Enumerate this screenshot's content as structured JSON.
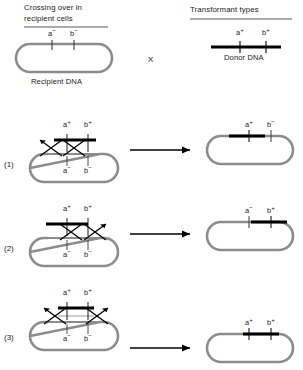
{
  "figure": {
    "title_left": "Crossing over in recipient cells",
    "title_left_line1": "Crossing over in",
    "title_left_line2": "recipient cells",
    "title_right": "Transformant types",
    "recipient_caption": "Recipient DNA",
    "donor_caption": "Donor DNA",
    "cross_symbol": "X",
    "colors": {
      "recipient_dna": "#8c8c8c",
      "donor_dna": "#000000",
      "text": "#1a1a1a",
      "arrow": "#000000",
      "rule": "#5a5a5a",
      "background": "#ffffff"
    }
  },
  "top": {
    "recipient": {
      "markers": [
        {
          "label": "a",
          "sign": "−"
        },
        {
          "label": "b",
          "sign": "−"
        }
      ]
    },
    "donor": {
      "markers": [
        {
          "label": "a",
          "sign": "+"
        },
        {
          "label": "b",
          "sign": "+"
        }
      ]
    }
  },
  "rows": [
    {
      "number": "(1)",
      "donor_top": {
        "markers": [
          {
            "label": "a",
            "sign": "+"
          },
          {
            "label": "b",
            "sign": "+"
          }
        ]
      },
      "recipient_bottom": {
        "markers": [
          {
            "label": "a",
            "sign": "−"
          },
          {
            "label": "b",
            "sign": "−"
          }
        ]
      },
      "crossover_count": 2,
      "crossover_positions": [
        "left-of-a",
        "between-a-and-b"
      ],
      "transformant": {
        "markers": [
          {
            "label": "a",
            "sign": "+"
          },
          {
            "label": "b",
            "sign": "−"
          }
        ],
        "integrated_segment": "a-only"
      }
    },
    {
      "number": "(2)",
      "donor_top": {
        "markers": [
          {
            "label": "a",
            "sign": "+"
          },
          {
            "label": "b",
            "sign": "+"
          }
        ]
      },
      "recipient_bottom": {
        "markers": [
          {
            "label": "a",
            "sign": "−"
          },
          {
            "label": "b",
            "sign": "−"
          }
        ]
      },
      "crossover_count": 2,
      "crossover_positions": [
        "between-a-and-b",
        "right-of-b"
      ],
      "transformant": {
        "markers": [
          {
            "label": "a",
            "sign": "−"
          },
          {
            "label": "b",
            "sign": "+"
          }
        ],
        "integrated_segment": "b-only"
      }
    },
    {
      "number": "(3)",
      "donor_top": {
        "markers": [
          {
            "label": "a",
            "sign": "+"
          },
          {
            "label": "b",
            "sign": "+"
          }
        ]
      },
      "recipient_bottom": {
        "markers": [
          {
            "label": "a",
            "sign": "−"
          },
          {
            "label": "b",
            "sign": "−"
          }
        ]
      },
      "crossover_count": 2,
      "crossover_positions": [
        "left-of-a",
        "right-of-b"
      ],
      "transformant": {
        "markers": [
          {
            "label": "a",
            "sign": "+"
          },
          {
            "label": "b",
            "sign": "+"
          }
        ],
        "integrated_segment": "a-and-b"
      }
    }
  ]
}
